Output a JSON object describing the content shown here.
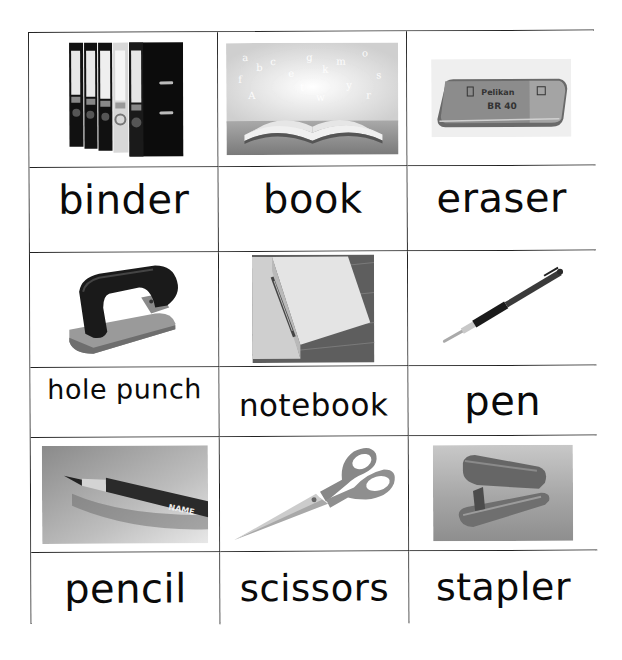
{
  "worksheet": {
    "title": "School supplies vocabulary cards",
    "items": [
      {
        "id": "binder",
        "label": "binder",
        "picture": "binder-icon",
        "desc": "row of black and white lever-arch binders"
      },
      {
        "id": "book",
        "label": "book",
        "picture": "book-icon",
        "desc": "open book with letters floating above"
      },
      {
        "id": "eraser",
        "label": "eraser",
        "picture": "eraser-icon",
        "desc": "rubber eraser",
        "print": {
          "brand": "Pelikan",
          "model": "BR 40"
        }
      },
      {
        "id": "hole-punch",
        "label": "hole punch",
        "picture": "hole-punch-icon",
        "desc": "two-hole paper punch"
      },
      {
        "id": "notebook",
        "label": "notebook",
        "picture": "notebook-icon",
        "desc": "open notebook with pen on wooden table"
      },
      {
        "id": "pen",
        "label": "pen",
        "picture": "pen-icon",
        "desc": "ballpoint pen with rubber grip"
      },
      {
        "id": "pencil",
        "label": "pencil",
        "picture": "pencil-icon",
        "desc": "sharpened pencil",
        "print": {
          "name_tag": "NAME"
        }
      },
      {
        "id": "scissors",
        "label": "scissors",
        "picture": "scissors-icon",
        "desc": "pair of scissors"
      },
      {
        "id": "stapler",
        "label": "stapler",
        "picture": "stapler-icon",
        "desc": "desktop stapler"
      }
    ]
  },
  "colors": {
    "grid_line": "#222222",
    "text": "#0a0a0a",
    "background": "#ffffff"
  }
}
